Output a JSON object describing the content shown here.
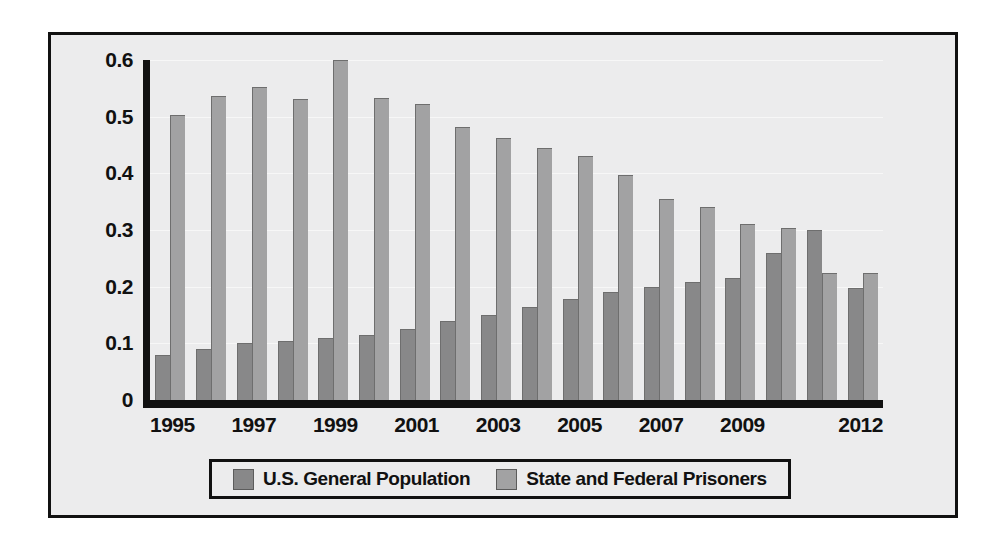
{
  "chart_data": {
    "type": "bar",
    "title": "",
    "xlabel": "",
    "ylabel": "",
    "ylim": [
      0,
      0.6
    ],
    "yticks": [
      "0",
      "0.1",
      "0.2",
      "0.3",
      "0.4",
      "0.5",
      "0.6"
    ],
    "ytick_values": [
      0,
      0.1,
      0.2,
      0.3,
      0.4,
      0.5,
      0.6
    ],
    "grid": true,
    "legend_position": "bottom",
    "categories": [
      "1995",
      "1996",
      "1997",
      "1998",
      "1999",
      "2000",
      "2001",
      "2002",
      "2003",
      "2004",
      "2005",
      "2006",
      "2007",
      "2008",
      "2009",
      "2010",
      "2011",
      "2012"
    ],
    "xtick_labels": [
      "1995",
      "",
      "1997",
      "",
      "1999",
      "",
      "2001",
      "",
      "2003",
      "",
      "2005",
      "",
      "2007",
      "",
      "2009",
      "",
      "",
      "2012"
    ],
    "series": [
      {
        "name": "U.S. General Population",
        "color": "#888889",
        "values": [
          0.08,
          0.09,
          0.1,
          0.105,
          0.11,
          0.115,
          0.125,
          0.14,
          0.15,
          0.165,
          0.178,
          0.19,
          0.2,
          0.208,
          0.215,
          0.26,
          0.3,
          0.197
        ]
      },
      {
        "name": "State and Federal Prisoners",
        "color": "#a2a2a3",
        "values": [
          0.503,
          0.537,
          0.552,
          0.532,
          0.6,
          0.533,
          0.523,
          0.482,
          0.463,
          0.444,
          0.431,
          0.397,
          0.355,
          0.34,
          0.31,
          0.303,
          0.225,
          0.225
        ]
      }
    ]
  },
  "legend": {
    "entries": [
      {
        "label": "U.S. General Population",
        "color": "#888889"
      },
      {
        "label": "State and Federal Prisoners",
        "color": "#a2a2a3"
      }
    ]
  }
}
